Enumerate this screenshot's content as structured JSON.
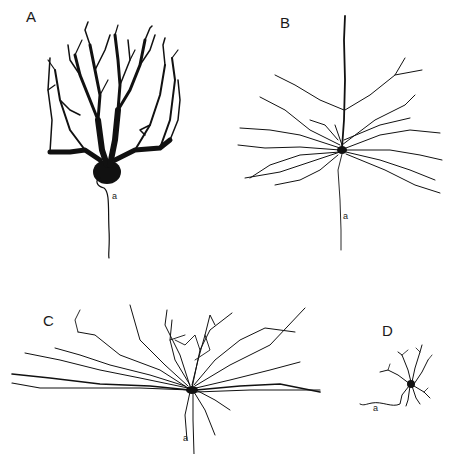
{
  "figure": {
    "panels": [
      {
        "id": "A",
        "label": "A",
        "axon_label": "a",
        "description": "Purkinje cell"
      },
      {
        "id": "B",
        "label": "B",
        "axon_label": "a",
        "description": "Pyramidal cell"
      },
      {
        "id": "C",
        "label": "C",
        "axon_label": "a",
        "description": "Wide-field neuron"
      },
      {
        "id": "D",
        "label": "D",
        "axon_label": "a",
        "description": "Small stellate neuron"
      }
    ],
    "colors": {
      "background": "#ffffff",
      "ink": "#111111"
    }
  }
}
